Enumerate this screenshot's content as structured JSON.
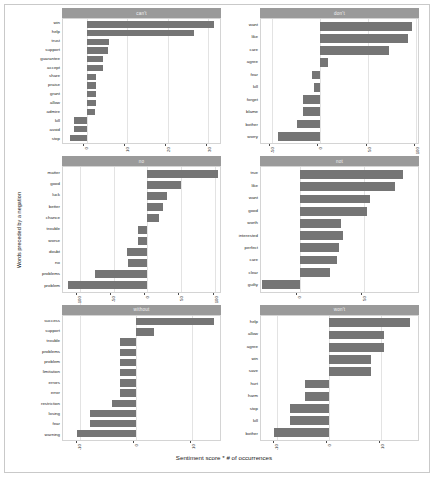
{
  "chart_data": {
    "type": "bar",
    "title": "",
    "xlabel": "Sentiment score * # of occurrences",
    "ylabel": "Words preceded by a negation",
    "orientation": "horizontal",
    "grid": true,
    "legend": "none",
    "bar_color": "#757575",
    "strip_color": "#9a9a9a",
    "facets": [
      {
        "label": "can't",
        "xlim": [
          -6,
          33
        ],
        "xticks": [
          0,
          10,
          20,
          30
        ],
        "xticklabels": [
          "0",
          "10",
          "20",
          "30"
        ],
        "categories": [
          "win",
          "help",
          "trust",
          "support",
          "guarantee",
          "accept",
          "share",
          "praise",
          "grant",
          "allow",
          "admire",
          "kill",
          "avoid",
          "stop"
        ],
        "values": [
          31.5,
          26.5,
          5.5,
          5.2,
          4.0,
          3.9,
          2.2,
          2.2,
          2.1,
          2.1,
          2.0,
          -3.2,
          -3.2,
          -4.3
        ]
      },
      {
        "label": "don't",
        "xlim": [
          -62,
          102
        ],
        "xticks": [
          -50,
          0,
          50,
          100
        ],
        "xticklabels": [
          "-50",
          "0",
          "50",
          "100"
        ],
        "categories": [
          "want",
          "like",
          "care",
          "agree",
          "fear",
          "kill",
          "forget",
          "blame",
          "bother",
          "worry"
        ],
        "values": [
          96,
          92,
          72,
          8.5,
          -9,
          -7,
          -18,
          -18,
          -24,
          -44
        ]
      },
      {
        "label": "no",
        "xlim": [
          -125,
          108
        ],
        "xticks": [
          -100,
          -50,
          0,
          50,
          100
        ],
        "xticklabels": [
          "-100",
          "-50",
          "0",
          "50",
          "100"
        ],
        "categories": [
          "matter",
          "good",
          "luck",
          "better",
          "chance",
          "trouble",
          "worse",
          "doubt",
          "no",
          "problems",
          "problem"
        ],
        "values": [
          105,
          50,
          30,
          24,
          17,
          -14,
          -14,
          -30,
          -28,
          -78,
          -118
        ]
      },
      {
        "label": "not",
        "xlim": [
          -30,
          92
        ],
        "xticks": [
          0,
          50
        ],
        "xticklabels": [
          "0",
          "50"
        ],
        "categories": [
          "true",
          "like",
          "want",
          "good",
          "worth",
          "interested",
          "perfect",
          "care",
          "clear",
          "guilty"
        ],
        "values": [
          80,
          74,
          55,
          52,
          32,
          34,
          31,
          29,
          24,
          -29
        ]
      },
      {
        "label": "without",
        "xlim": [
          -13,
          15
        ],
        "xticks": [
          -10,
          0,
          10
        ],
        "xticklabels": [
          "-10",
          "0",
          "10"
        ],
        "categories": [
          "success",
          "support",
          "trouble",
          "problems",
          "problem",
          "limitation",
          "errors",
          "error",
          "restriction",
          "losing",
          "fear",
          "warning"
        ],
        "values": [
          14,
          3.2,
          -2.8,
          -2.8,
          -2.8,
          -2.8,
          -2.8,
          -2.8,
          -4.3,
          -8.2,
          -8.2,
          -10.5
        ]
      },
      {
        "label": "won't",
        "xlim": [
          -13,
          17
        ],
        "xticks": [
          -10,
          0,
          10
        ],
        "xticklabels": [
          "-10",
          "0",
          "10"
        ],
        "categories": [
          "help",
          "allow",
          "agree",
          "win",
          "save",
          "hurt",
          "harm",
          "stop",
          "kill",
          "bother"
        ],
        "values": [
          15.5,
          10.5,
          10.5,
          8.0,
          8.0,
          -4.5,
          -4.5,
          -7.5,
          -7.5,
          -10.5
        ]
      }
    ]
  }
}
